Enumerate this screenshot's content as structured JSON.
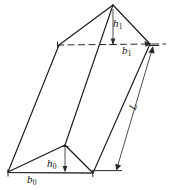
{
  "figure": {
    "name": "oblique-triangular-prism-diagram",
    "colors": {
      "background": "#ffffff",
      "edge": "#1a1a1a",
      "hidden_edge": "#2a2a2a",
      "dimension": "#3a3a3a",
      "label": "#111111"
    },
    "labels": [
      {
        "id": "h1",
        "symbol": "h",
        "subscript": "1",
        "meaning": "height of top triangle"
      },
      {
        "id": "b1",
        "symbol": "b",
        "subscript": "1",
        "meaning": "base width of top triangle"
      },
      {
        "id": "L",
        "symbol": "L",
        "subscript": "",
        "meaning": "length of prism"
      },
      {
        "id": "h0",
        "symbol": "h",
        "subscript": "0",
        "meaning": "height of bottom triangle"
      },
      {
        "id": "b0",
        "symbol": "b",
        "subscript": "0",
        "meaning": "base width of bottom triangle"
      }
    ],
    "label_text": {
      "h1_symbol": "h",
      "h1_sub": "1",
      "b1_symbol": "b",
      "b1_sub": "1",
      "L_symbol": "L",
      "h0_symbol": "h",
      "h0_sub": "0",
      "b0_symbol": "b",
      "b0_sub": "0"
    }
  },
  "geometry": {
    "top_face": {
      "apex": [
        113,
        5
      ],
      "left": [
        59,
        45
      ],
      "right": [
        150,
        44
      ]
    },
    "bottom_face": {
      "apex": [
        65,
        145
      ],
      "left": [
        8,
        172
      ],
      "right": [
        93,
        173
      ]
    },
    "dimension_lines": {
      "h1": {
        "from": [
          113,
          5
        ],
        "to": [
          113,
          45
        ]
      },
      "b1": {
        "from": [
          59,
          45
        ],
        "to": [
          150,
          44
        ]
      },
      "L": {
        "from": [
          152,
          47
        ],
        "to": [
          116,
          170
        ]
      },
      "h0": {
        "from": [
          65,
          145
        ],
        "to": [
          65,
          173
        ]
      },
      "b0": {
        "from": [
          8,
          173
        ],
        "to": [
          93,
          173
        ]
      }
    }
  }
}
